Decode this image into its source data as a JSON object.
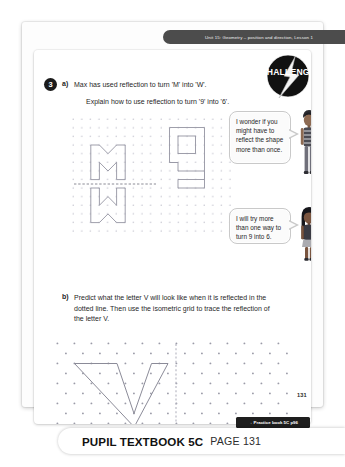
{
  "banner": {
    "unit_text": "Unit 15: Geometry – position and direction, Lesson 1"
  },
  "badge": {
    "label": "CHALLENGE",
    "icon": "lightning-bolt-icon",
    "color": "#111111"
  },
  "question": {
    "number": "3",
    "part_a": {
      "label": "a)",
      "line_1": "Max has used reflection to turn 'M' into 'W'.",
      "line_2": "Explain how to use reflection to turn '9' into '6'."
    },
    "part_b": {
      "label": "b)",
      "text": "Predict what the letter V will look like when it is reflected in the dotted line. Then use the isometric grid to trace the reflection of the letter V."
    }
  },
  "grids": {
    "square_grid_mw": {
      "type": "square-dot-grid",
      "letter_above": "M",
      "letter_below": "W",
      "mirror_line": "horizontal-dotted"
    },
    "square_grid_nine": {
      "type": "square-dot-grid",
      "digit": "9"
    },
    "isometric_grid": {
      "type": "isometric-dot-grid",
      "letter": "V",
      "mirror_line": "vertical-dotted"
    }
  },
  "bubbles": [
    {
      "speaker": "boy-character",
      "text": "I wonder if you might have to reflect the shape more than once."
    },
    {
      "speaker": "girl-character",
      "text": "I will try more than one way to turn 9 into 6."
    }
  ],
  "footer": {
    "practice_tag": "→ Practice book 5C p96",
    "corner_page_number": "131",
    "title": "PUPIL TEXTBOOK 5C",
    "page_label": "PAGE 131"
  }
}
